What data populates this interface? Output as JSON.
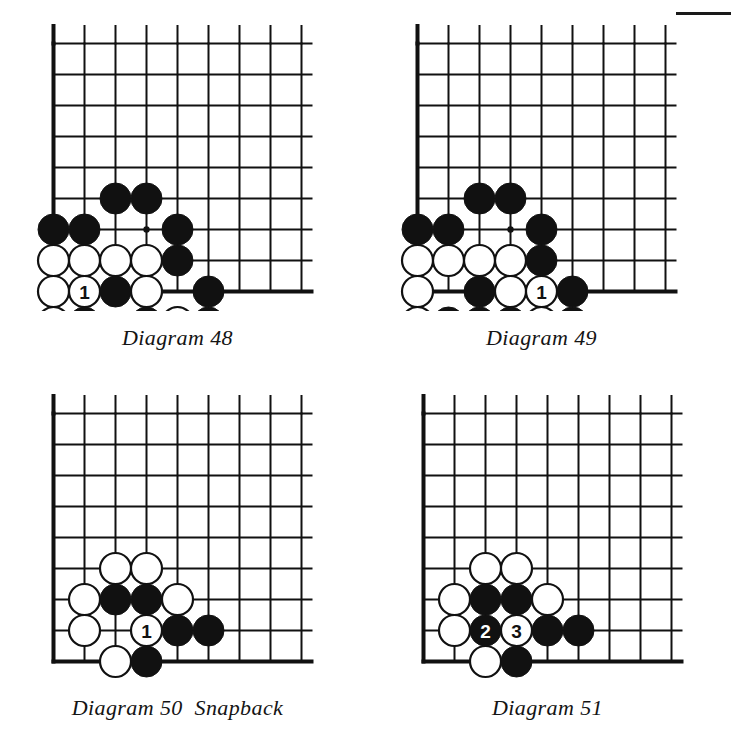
{
  "page": {
    "background_color": "#ffffff",
    "ink_color": "#111111",
    "black_stone_color": "#111111",
    "white_stone_color": "#ffffff",
    "stone_outline_color": "#111111"
  },
  "board_geometry": {
    "columns": 9,
    "rows": 9,
    "cell_size": 31,
    "stone_radius": 15.5,
    "edge_line_width": 4,
    "inner_line_width": 2,
    "note": "Upper-left corner of the board; left edge and bottom edge are thick board borders."
  },
  "diagrams": [
    {
      "id": "diagram-48",
      "caption": "Diagram 48",
      "x": 34,
      "y": 24,
      "cols": 9,
      "rows": 9,
      "edges": {
        "left": true,
        "top": false,
        "right": false,
        "bottom": true
      },
      "star_points": [
        {
          "col": 3,
          "row": 6
        }
      ],
      "stones": [
        {
          "col": 2,
          "row": 5,
          "color": "black",
          "label": ""
        },
        {
          "col": 3,
          "row": 5,
          "color": "black",
          "label": ""
        },
        {
          "col": 0,
          "row": 6,
          "color": "black",
          "label": ""
        },
        {
          "col": 1,
          "row": 6,
          "color": "black",
          "label": ""
        },
        {
          "col": 4,
          "row": 6,
          "color": "black",
          "label": ""
        },
        {
          "col": 0,
          "row": 7,
          "color": "white",
          "label": ""
        },
        {
          "col": 1,
          "row": 7,
          "color": "white",
          "label": ""
        },
        {
          "col": 2,
          "row": 7,
          "color": "white",
          "label": ""
        },
        {
          "col": 3,
          "row": 7,
          "color": "white",
          "label": ""
        },
        {
          "col": 4,
          "row": 7,
          "color": "black",
          "label": ""
        },
        {
          "col": 0,
          "row": 8,
          "color": "white",
          "label": ""
        },
        {
          "col": 1,
          "row": 8,
          "color": "white",
          "label": "1"
        },
        {
          "col": 2,
          "row": 8,
          "color": "black",
          "label": ""
        },
        {
          "col": 3,
          "row": 8,
          "color": "white",
          "label": ""
        },
        {
          "col": 5,
          "row": 8,
          "color": "black",
          "label": ""
        },
        {
          "col": 0,
          "row": 9,
          "color": "white",
          "label": ""
        },
        {
          "col": 1,
          "row": 9,
          "color": "black",
          "label": ""
        },
        {
          "col": 3,
          "row": 9,
          "color": "black",
          "label": ""
        },
        {
          "col": 4,
          "row": 9,
          "color": "white",
          "label": ""
        },
        {
          "col": 5,
          "row": 9,
          "color": "black",
          "label": ""
        }
      ],
      "point_labels": [
        {
          "col": 2,
          "row": 9,
          "text": "a"
        }
      ]
    },
    {
      "id": "diagram-49",
      "caption": "Diagram 49",
      "x": 398,
      "y": 24,
      "cols": 9,
      "rows": 9,
      "edges": {
        "left": true,
        "top": false,
        "right": false,
        "bottom": true
      },
      "star_points": [
        {
          "col": 3,
          "row": 6
        }
      ],
      "stones": [
        {
          "col": 2,
          "row": 5,
          "color": "black",
          "label": ""
        },
        {
          "col": 3,
          "row": 5,
          "color": "black",
          "label": ""
        },
        {
          "col": 0,
          "row": 6,
          "color": "black",
          "label": ""
        },
        {
          "col": 1,
          "row": 6,
          "color": "black",
          "label": ""
        },
        {
          "col": 4,
          "row": 6,
          "color": "black",
          "label": ""
        },
        {
          "col": 0,
          "row": 7,
          "color": "white",
          "label": ""
        },
        {
          "col": 1,
          "row": 7,
          "color": "white",
          "label": ""
        },
        {
          "col": 2,
          "row": 7,
          "color": "white",
          "label": ""
        },
        {
          "col": 3,
          "row": 7,
          "color": "white",
          "label": ""
        },
        {
          "col": 4,
          "row": 7,
          "color": "black",
          "label": ""
        },
        {
          "col": 0,
          "row": 8,
          "color": "white",
          "label": ""
        },
        {
          "col": 2,
          "row": 8,
          "color": "black",
          "label": ""
        },
        {
          "col": 3,
          "row": 8,
          "color": "white",
          "label": ""
        },
        {
          "col": 4,
          "row": 8,
          "color": "white",
          "label": "1"
        },
        {
          "col": 5,
          "row": 8,
          "color": "black",
          "label": ""
        },
        {
          "col": 0,
          "row": 9,
          "color": "white",
          "label": ""
        },
        {
          "col": 1,
          "row": 9,
          "color": "black",
          "label": ""
        },
        {
          "col": 2,
          "row": 9,
          "color": "black",
          "label": "2"
        },
        {
          "col": 3,
          "row": 9,
          "color": "black",
          "label": ""
        },
        {
          "col": 4,
          "row": 9,
          "color": "white",
          "label": ""
        },
        {
          "col": 5,
          "row": 9,
          "color": "black",
          "label": ""
        }
      ],
      "point_labels": []
    },
    {
      "id": "diagram-50",
      "caption": "Diagram 50  Snapback",
      "x": 34,
      "y": 394,
      "cols": 9,
      "rows": 9,
      "edges": {
        "left": true,
        "top": false,
        "right": false,
        "bottom": true
      },
      "star_points": [],
      "stones": [
        {
          "col": 2,
          "row": 5,
          "color": "white",
          "label": ""
        },
        {
          "col": 3,
          "row": 5,
          "color": "white",
          "label": ""
        },
        {
          "col": 1,
          "row": 6,
          "color": "white",
          "label": ""
        },
        {
          "col": 2,
          "row": 6,
          "color": "black",
          "label": ""
        },
        {
          "col": 3,
          "row": 6,
          "color": "black",
          "label": ""
        },
        {
          "col": 4,
          "row": 6,
          "color": "white",
          "label": ""
        },
        {
          "col": 1,
          "row": 7,
          "color": "white",
          "label": ""
        },
        {
          "col": 3,
          "row": 7,
          "color": "white",
          "label": "1"
        },
        {
          "col": 4,
          "row": 7,
          "color": "black",
          "label": ""
        },
        {
          "col": 5,
          "row": 7,
          "color": "black",
          "label": ""
        },
        {
          "col": 2,
          "row": 8,
          "color": "white",
          "label": ""
        },
        {
          "col": 3,
          "row": 8,
          "color": "black",
          "label": ""
        }
      ],
      "point_labels": []
    },
    {
      "id": "diagram-51",
      "caption": "Diagram 51",
      "x": 404,
      "y": 394,
      "cols": 9,
      "rows": 9,
      "edges": {
        "left": true,
        "top": false,
        "right": false,
        "bottom": true
      },
      "star_points": [],
      "stones": [
        {
          "col": 2,
          "row": 5,
          "color": "white",
          "label": ""
        },
        {
          "col": 3,
          "row": 5,
          "color": "white",
          "label": ""
        },
        {
          "col": 1,
          "row": 6,
          "color": "white",
          "label": ""
        },
        {
          "col": 2,
          "row": 6,
          "color": "black",
          "label": ""
        },
        {
          "col": 3,
          "row": 6,
          "color": "black",
          "label": ""
        },
        {
          "col": 4,
          "row": 6,
          "color": "white",
          "label": ""
        },
        {
          "col": 1,
          "row": 7,
          "color": "white",
          "label": ""
        },
        {
          "col": 2,
          "row": 7,
          "color": "black",
          "label": "2"
        },
        {
          "col": 3,
          "row": 7,
          "color": "white",
          "label": "3"
        },
        {
          "col": 4,
          "row": 7,
          "color": "black",
          "label": ""
        },
        {
          "col": 5,
          "row": 7,
          "color": "black",
          "label": ""
        },
        {
          "col": 2,
          "row": 8,
          "color": "white",
          "label": ""
        },
        {
          "col": 3,
          "row": 8,
          "color": "black",
          "label": ""
        }
      ],
      "point_labels": []
    }
  ]
}
